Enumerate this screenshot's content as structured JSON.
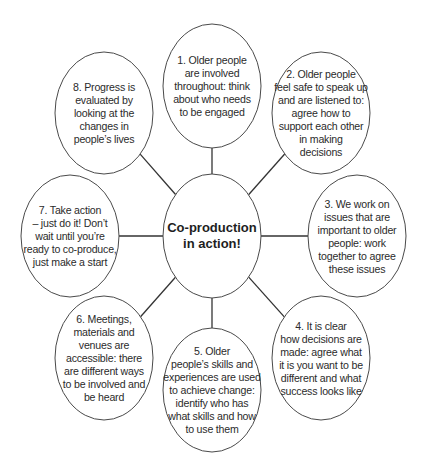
{
  "diagram": {
    "type": "hub-and-spoke",
    "center": {
      "lines": [
        "Co-production",
        "in action!"
      ]
    },
    "nodes": [
      {
        "id": 1,
        "lines": [
          "1. Older people",
          "are involved",
          "throughout: think",
          "about who needs",
          "to be engaged"
        ]
      },
      {
        "id": 2,
        "lines": [
          "2. Older people",
          "feel safe to speak up",
          "and are listened to:",
          "agree how to",
          "support each other",
          "in making",
          "decisions"
        ]
      },
      {
        "id": 3,
        "lines": [
          "3. We work on",
          "issues that are",
          "important to older",
          "people: work",
          "together to agree",
          "these issues"
        ]
      },
      {
        "id": 4,
        "lines": [
          "4. It is clear",
          "how decisions are",
          "made: agree what",
          "it is you want to be",
          "different and what",
          "success looks like"
        ]
      },
      {
        "id": 5,
        "lines": [
          "5. Older",
          "people’s skills and",
          "experiences are used",
          "to achieve change:",
          "identify who has",
          "what skills and how",
          "to use them"
        ]
      },
      {
        "id": 6,
        "lines": [
          "6. Meetings,",
          "materials and",
          "venues are",
          "accessible: there",
          "are different ways",
          "to be involved and",
          "be heard"
        ]
      },
      {
        "id": 7,
        "lines": [
          "7. Take action",
          "– just do it! Don’t",
          "wait until you’re",
          "ready to co-produce,",
          "just make a start"
        ]
      },
      {
        "id": 8,
        "lines": [
          "8. Progress is",
          "evaluated by",
          "looking at the",
          "changes in",
          "people’s lives"
        ]
      }
    ],
    "colors": {
      "stroke": "#4a4a4a",
      "text": "#2b2b2b",
      "background": "#ffffff"
    }
  }
}
